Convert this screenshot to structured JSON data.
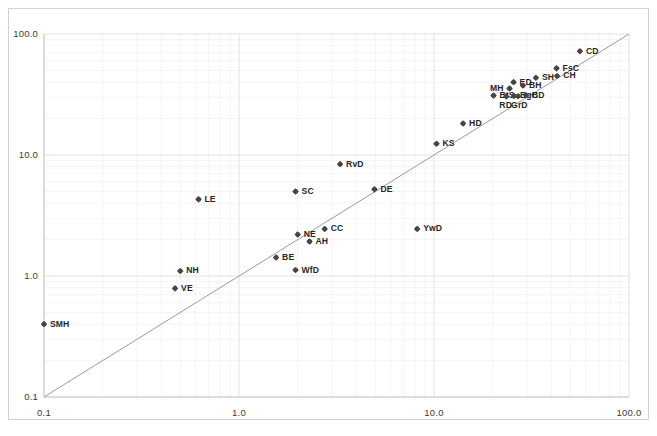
{
  "chart_data": {
    "type": "scatter",
    "title": "",
    "xlabel": "",
    "ylabel": "",
    "xscale": "log",
    "yscale": "log",
    "xlim": [
      0.1,
      100.0
    ],
    "ylim": [
      0.1,
      100.0
    ],
    "grid": true,
    "legend": null,
    "reference_line": {
      "name": "y = x identity line",
      "from": [
        0.1,
        0.1
      ],
      "to": [
        100.0,
        100.0
      ],
      "color": "#9a9a9a"
    },
    "xticks": [
      "0.1",
      "1.0",
      "10.0",
      "100.0"
    ],
    "xtick_values": [
      0.1,
      1.0,
      10.0,
      100.0
    ],
    "yticks": [
      "0.1",
      "1.0",
      "10.0",
      "100.0"
    ],
    "ytick_values": [
      0.1,
      1.0,
      10.0,
      100.0
    ],
    "marker": "diamond",
    "marker_color": "#464646",
    "points": [
      {
        "label": "SMH",
        "x": 0.1,
        "y": 0.4,
        "pos": "r"
      },
      {
        "label": "VE",
        "x": 0.47,
        "y": 0.79,
        "pos": "r"
      },
      {
        "label": "NH",
        "x": 0.5,
        "y": 1.1,
        "pos": "r"
      },
      {
        "label": "LE",
        "x": 0.62,
        "y": 4.3,
        "pos": "r"
      },
      {
        "label": "BE",
        "x": 1.55,
        "y": 1.42,
        "pos": "r"
      },
      {
        "label": "WfD",
        "x": 1.95,
        "y": 1.12,
        "pos": "r"
      },
      {
        "label": "NE",
        "x": 2.0,
        "y": 2.2,
        "pos": "r"
      },
      {
        "label": "SC",
        "x": 1.95,
        "y": 5.0,
        "pos": "r"
      },
      {
        "label": "AH",
        "x": 2.3,
        "y": 1.93,
        "pos": "r"
      },
      {
        "label": "CC",
        "x": 2.75,
        "y": 2.45,
        "pos": "r"
      },
      {
        "label": "RvD",
        "x": 3.3,
        "y": 8.4,
        "pos": "r"
      },
      {
        "label": "DE",
        "x": 4.95,
        "y": 5.2,
        "pos": "r"
      },
      {
        "label": "YwD",
        "x": 8.2,
        "y": 2.45,
        "pos": "r"
      },
      {
        "label": "KS",
        "x": 10.3,
        "y": 12.4,
        "pos": "r"
      },
      {
        "label": "HD",
        "x": 14.1,
        "y": 18.2,
        "pos": "r"
      },
      {
        "label": "BtS",
        "x": 20.2,
        "y": 31.0,
        "pos": "r"
      },
      {
        "label": "RD",
        "x": 23.5,
        "y": 30.5,
        "pos": "b"
      },
      {
        "label": "MH",
        "x": 24.4,
        "y": 35.5,
        "pos": "l"
      },
      {
        "label": "ED",
        "x": 25.6,
        "y": 40.0,
        "pos": "r"
      },
      {
        "label": "BgC",
        "x": 25.7,
        "y": 30.8,
        "pos": "r"
      },
      {
        "label": "GrD",
        "x": 27.0,
        "y": 30.6,
        "pos": "b"
      },
      {
        "label": "BH",
        "x": 28.6,
        "y": 37.5,
        "pos": "r"
      },
      {
        "label": "BD",
        "x": 29.6,
        "y": 31.2,
        "pos": "r"
      },
      {
        "label": "SH",
        "x": 33.3,
        "y": 43.5,
        "pos": "r"
      },
      {
        "label": "FsC",
        "x": 42.5,
        "y": 52.0,
        "pos": "r"
      },
      {
        "label": "CH",
        "x": 42.8,
        "y": 45.0,
        "pos": "r"
      },
      {
        "label": "CD",
        "x": 56.0,
        "y": 72.0,
        "pos": "r"
      }
    ]
  }
}
